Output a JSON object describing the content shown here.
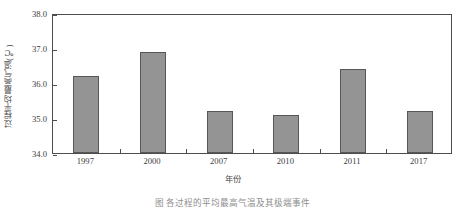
{
  "chart_data": {
    "type": "bar",
    "title": "",
    "xlabel": "年份",
    "ylabel": "过程平均最高气温(℃)",
    "categories": [
      "1997",
      "2000",
      "2007",
      "2010",
      "2011",
      "2017"
    ],
    "values": [
      36.2,
      36.9,
      35.2,
      35.1,
      36.4,
      35.2
    ],
    "ylim": [
      34.0,
      38.0
    ],
    "ytick_labels": [
      "34.0",
      "35.0",
      "36.0",
      "37.0",
      "38.0"
    ],
    "ytick_values": [
      34.0,
      35.0,
      36.0,
      37.0,
      38.0
    ],
    "grid": false,
    "legend": null,
    "bar_color": "#949494",
    "bar_edge_color": "#575757",
    "axis_color": "#4d4d4d"
  },
  "caption": {
    "figure_label": "图",
    "figure_text": "各过程的平均最高气温及其极端事件"
  }
}
